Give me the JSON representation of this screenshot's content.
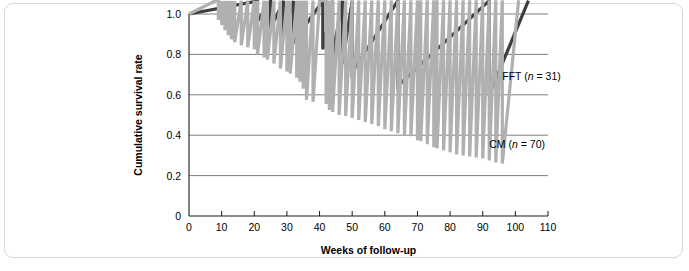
{
  "figure": {
    "frame_color": "#d7d7d7",
    "background": "#ffffff"
  },
  "chart_data": {
    "type": "line",
    "subtype": "kaplan-meier-step",
    "title": "",
    "xlabel": "Weeks of follow-up",
    "ylabel": "Cumulative survival rate",
    "xlim": [
      0,
      110
    ],
    "ylim": [
      0,
      1.0
    ],
    "xticks": [
      0,
      10,
      20,
      30,
      40,
      50,
      60,
      70,
      80,
      90,
      100,
      110
    ],
    "xtick_labels": [
      "0",
      "10",
      "20",
      "30",
      "40",
      "50",
      "60",
      "70",
      "80",
      "90",
      "100",
      "110"
    ],
    "yticks": [
      0,
      0.2,
      0.4,
      0.6,
      0.8,
      1.0
    ],
    "ytick_labels": [
      "0",
      "0.2",
      "0.4",
      "0.6",
      "0.8",
      "1.0"
    ],
    "grid": "horizontal",
    "gridlines_at": [
      0.2,
      0.4,
      0.6,
      0.8,
      1.0
    ],
    "legend": "inline-annotations",
    "series": [
      {
        "name": "FFT",
        "label": "FFT (n = 31)",
        "label_prefix": "FFT (",
        "label_italic": "n",
        "label_suffix": " = 31)",
        "n": 31,
        "color": "#3d3d3d",
        "final_value": 0.6,
        "x": [
          0,
          21,
          21,
          25,
          25,
          29,
          29,
          32,
          32,
          41,
          41,
          44,
          44,
          47,
          47,
          50,
          50,
          64,
          64,
          92,
          92,
          104
        ],
        "y": [
          1.0,
          1.0,
          0.965,
          0.965,
          0.93,
          0.93,
          0.895,
          0.895,
          0.86,
          0.86,
          0.825,
          0.825,
          0.79,
          0.79,
          0.755,
          0.755,
          0.71,
          0.71,
          0.645,
          0.645,
          0.6,
          0.6
        ]
      },
      {
        "name": "CM",
        "label": "CM (n = 70)",
        "label_prefix": "CM (",
        "label_italic": "n",
        "label_suffix": " = 70)",
        "n": 70,
        "color": "#b0b0b0",
        "final_value": 0.26,
        "x": [
          0,
          8,
          9,
          10,
          11,
          12,
          13,
          14,
          16,
          18,
          20,
          21,
          23,
          24,
          26,
          28,
          30,
          31,
          33,
          34,
          35,
          36,
          38,
          40,
          42,
          43,
          44,
          46,
          48,
          50,
          52,
          54,
          56,
          58,
          60,
          62,
          64,
          66,
          68,
          70,
          71,
          73,
          75,
          76,
          78,
          80,
          82,
          84,
          86,
          88,
          90,
          92,
          94,
          96,
          101
        ],
        "y": [
          1.0,
          1.0,
          0.97,
          0.945,
          0.92,
          0.895,
          0.875,
          0.86,
          0.845,
          0.835,
          0.825,
          0.8,
          0.785,
          0.775,
          0.755,
          0.73,
          0.715,
          0.705,
          0.685,
          0.665,
          0.63,
          0.575,
          0.565,
          0.565,
          0.555,
          0.525,
          0.515,
          0.5,
          0.495,
          0.485,
          0.475,
          0.465,
          0.455,
          0.445,
          0.43,
          0.42,
          0.41,
          0.4,
          0.395,
          0.375,
          0.37,
          0.355,
          0.34,
          0.335,
          0.325,
          0.315,
          0.305,
          0.3,
          0.295,
          0.29,
          0.285,
          0.275,
          0.265,
          0.26,
          0.26
        ]
      }
    ],
    "annotations": [
      {
        "text": "FFT (n = 31)",
        "x": 96,
        "y": 0.675
      },
      {
        "text": "CM (n = 70)",
        "x": 92,
        "y": 0.335
      }
    ]
  }
}
